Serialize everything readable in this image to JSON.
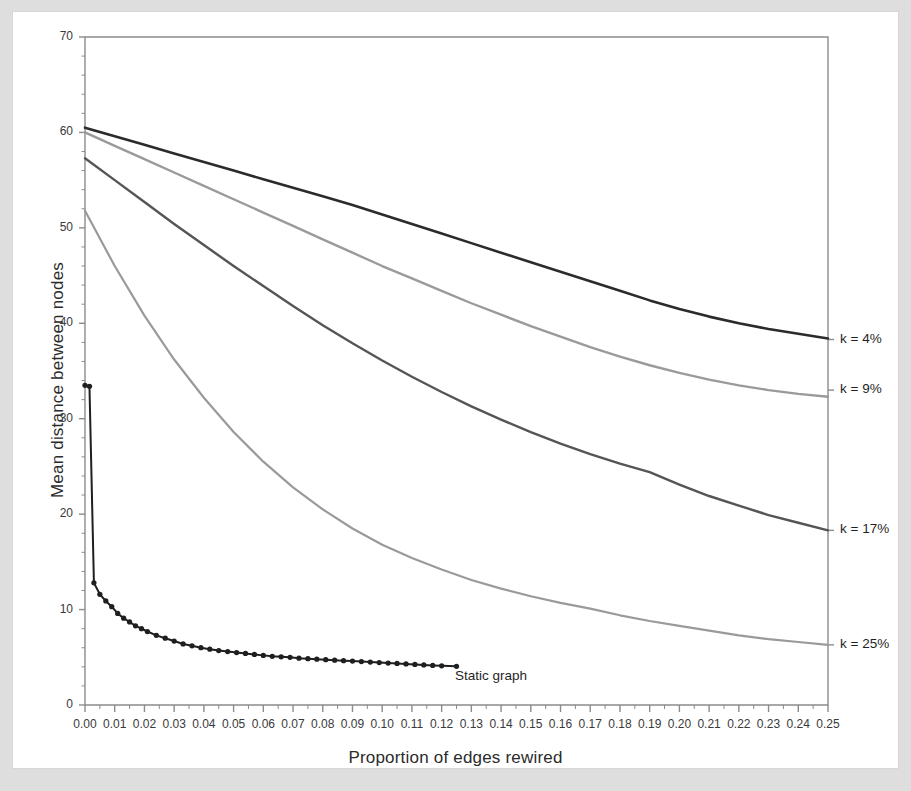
{
  "chart_data": {
    "type": "line",
    "title": "",
    "xlabel": "Proportion of edges rewired",
    "ylabel": "Mean distance between nodes",
    "xlim": [
      0.0,
      0.25
    ],
    "ylim": [
      0,
      70
    ],
    "grid": false,
    "legend_position": "right-of-axes",
    "x_tick_labels": [
      "0.00",
      "0.01",
      "0.02",
      "0.03",
      "0.04",
      "0.05",
      "0.06",
      "0.07",
      "0.08",
      "0.09",
      "0.10",
      "0.11",
      "0.12",
      "0.13",
      "0.14",
      "0.15",
      "0.16",
      "0.17",
      "0.18",
      "0.19",
      "0.20",
      "0.21",
      "0.22",
      "0.23",
      "0.24",
      "0.25"
    ],
    "x_tick_values": [
      0.0,
      0.01,
      0.02,
      0.03,
      0.04,
      0.05,
      0.06,
      0.07,
      0.08,
      0.09,
      0.1,
      0.11,
      0.12,
      0.13,
      0.14,
      0.15,
      0.16,
      0.17,
      0.18,
      0.19,
      0.2,
      0.21,
      0.22,
      0.23,
      0.24,
      0.25
    ],
    "y_tick_labels": [
      "0",
      "10",
      "20",
      "30",
      "40",
      "50",
      "60",
      "70"
    ],
    "y_tick_values": [
      0,
      10,
      20,
      30,
      40,
      50,
      60,
      70
    ],
    "y_minor_tick_step": 2,
    "annotations": [
      {
        "text": "Static graph",
        "x": 0.125,
        "y": 4.0
      }
    ],
    "series": [
      {
        "name": "k = 4%",
        "label": "k = 4%",
        "color": "#2b2b2b",
        "width": 2.6,
        "marker": "none",
        "label_x": 0.253,
        "label_y": 38.3,
        "x": [
          0.0,
          0.01,
          0.02,
          0.03,
          0.04,
          0.05,
          0.06,
          0.07,
          0.08,
          0.09,
          0.1,
          0.11,
          0.12,
          0.13,
          0.14,
          0.15,
          0.16,
          0.17,
          0.18,
          0.19,
          0.2,
          0.21,
          0.22,
          0.23,
          0.24,
          0.25
        ],
        "values": [
          60.5,
          59.6,
          58.7,
          57.8,
          56.9,
          56.0,
          55.1,
          54.2,
          53.3,
          52.4,
          51.4,
          50.4,
          49.4,
          48.4,
          47.4,
          46.4,
          45.4,
          44.4,
          43.4,
          42.4,
          41.5,
          40.7,
          40.0,
          39.4,
          38.9,
          38.4
        ]
      },
      {
        "name": "k = 9%",
        "label": "k = 9%",
        "color": "#9a9a9a",
        "width": 2.4,
        "marker": "none",
        "label_x": 0.253,
        "label_y": 33.0,
        "x": [
          0.0,
          0.01,
          0.02,
          0.03,
          0.04,
          0.05,
          0.06,
          0.07,
          0.08,
          0.09,
          0.1,
          0.11,
          0.12,
          0.13,
          0.14,
          0.15,
          0.16,
          0.17,
          0.18,
          0.19,
          0.2,
          0.21,
          0.22,
          0.23,
          0.24,
          0.25
        ],
        "values": [
          60.0,
          58.6,
          57.2,
          55.8,
          54.4,
          53.0,
          51.6,
          50.2,
          48.8,
          47.4,
          46.0,
          44.7,
          43.4,
          42.1,
          40.9,
          39.7,
          38.6,
          37.5,
          36.5,
          35.6,
          34.8,
          34.1,
          33.5,
          33.0,
          32.6,
          32.3
        ]
      },
      {
        "name": "k = 17%",
        "label": "k = 17%",
        "color": "#555555",
        "width": 2.4,
        "marker": "none",
        "label_x": 0.253,
        "label_y": 18.3,
        "x": [
          0.0,
          0.01,
          0.02,
          0.03,
          0.04,
          0.05,
          0.06,
          0.07,
          0.08,
          0.09,
          0.1,
          0.11,
          0.12,
          0.13,
          0.14,
          0.15,
          0.16,
          0.17,
          0.18,
          0.19,
          0.2,
          0.21,
          0.22,
          0.23,
          0.24,
          0.25
        ],
        "values": [
          57.3,
          55.0,
          52.7,
          50.4,
          48.2,
          46.0,
          43.9,
          41.8,
          39.8,
          37.9,
          36.1,
          34.4,
          32.8,
          31.3,
          29.9,
          28.6,
          27.4,
          26.3,
          25.3,
          24.4,
          23.1,
          21.9,
          20.9,
          19.9,
          19.1,
          18.3
        ]
      },
      {
        "name": "k = 25%",
        "label": "k = 25%",
        "color": "#9a9a9a",
        "width": 2.2,
        "marker": "none",
        "label_x": 0.253,
        "label_y": 6.3,
        "x": [
          0.0,
          0.01,
          0.02,
          0.03,
          0.04,
          0.05,
          0.06,
          0.07,
          0.08,
          0.09,
          0.1,
          0.11,
          0.12,
          0.13,
          0.14,
          0.15,
          0.16,
          0.17,
          0.18,
          0.19,
          0.2,
          0.21,
          0.22,
          0.23,
          0.24,
          0.25
        ],
        "values": [
          51.8,
          46.0,
          40.8,
          36.2,
          32.2,
          28.6,
          25.5,
          22.8,
          20.5,
          18.5,
          16.8,
          15.4,
          14.2,
          13.1,
          12.2,
          11.4,
          10.7,
          10.1,
          9.4,
          8.8,
          8.3,
          7.8,
          7.3,
          6.9,
          6.6,
          6.3
        ]
      },
      {
        "name": "Static graph",
        "label": "Static graph",
        "color": "#1f1f1f",
        "width": 2.0,
        "marker": "circle",
        "marker_size": 4.2,
        "x": [
          0.0,
          0.0015,
          0.003,
          0.005,
          0.007,
          0.009,
          0.011,
          0.013,
          0.015,
          0.017,
          0.019,
          0.021,
          0.024,
          0.027,
          0.03,
          0.033,
          0.036,
          0.039,
          0.042,
          0.045,
          0.048,
          0.051,
          0.054,
          0.057,
          0.06,
          0.063,
          0.066,
          0.069,
          0.072,
          0.075,
          0.078,
          0.081,
          0.084,
          0.087,
          0.09,
          0.093,
          0.096,
          0.099,
          0.102,
          0.105,
          0.108,
          0.111,
          0.114,
          0.117,
          0.12,
          0.125
        ],
        "values": [
          33.5,
          33.4,
          12.8,
          11.6,
          10.9,
          10.3,
          9.6,
          9.1,
          8.7,
          8.3,
          8.0,
          7.7,
          7.3,
          7.0,
          6.7,
          6.4,
          6.2,
          6.0,
          5.85,
          5.7,
          5.6,
          5.5,
          5.4,
          5.3,
          5.2,
          5.1,
          5.05,
          5.0,
          4.9,
          4.85,
          4.8,
          4.75,
          4.7,
          4.65,
          4.6,
          4.55,
          4.5,
          4.45,
          4.4,
          4.35,
          4.3,
          4.25,
          4.2,
          4.15,
          4.1,
          4.05
        ]
      }
    ]
  },
  "figure": {
    "background_color": "#dedede",
    "sheet_color": "#ffffff",
    "axis_color": "#8c8c8c",
    "text_color": "#2b2b2b"
  }
}
